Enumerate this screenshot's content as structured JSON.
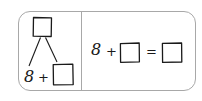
{
  "worksheet": {
    "left_panel": {
      "name": "number-bond",
      "whole_box": "",
      "part_addend": "8",
      "plus_sign": "+",
      "part_box": ""
    },
    "right_panel": {
      "name": "equation",
      "addend": "8",
      "plus_sign": "+",
      "missing_addend_box": "",
      "equals_sign": "=",
      "sum_box": ""
    }
  },
  "colors": {
    "ink": "#1a1a1a",
    "card_border": "#a8a8a8",
    "background": "#ffffff"
  }
}
